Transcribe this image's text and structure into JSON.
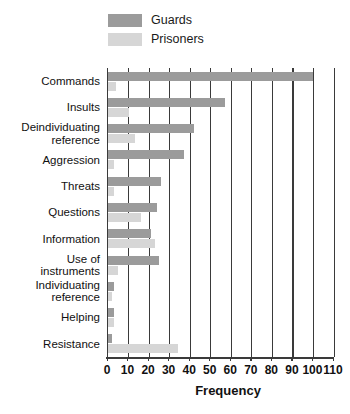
{
  "chart_data": {
    "type": "bar",
    "orientation": "horizontal",
    "title": "",
    "xlabel": "Frequency",
    "ylabel": "",
    "xlim": [
      0,
      110
    ],
    "xticks": [
      0,
      10,
      20,
      30,
      40,
      50,
      60,
      70,
      80,
      90,
      100,
      110
    ],
    "grid": true,
    "grid_axis": "x",
    "legend_position": "top-left",
    "categories": [
      "Commands",
      "Insults",
      "Deindividuating\nreference",
      "Aggression",
      "Threats",
      "Questions",
      "Information",
      "Use of\ninstruments",
      "Individuating\nreference",
      "Helping",
      "Resistance"
    ],
    "series": [
      {
        "name": "Guards",
        "color": "#9b9b9b",
        "values": [
          100,
          57,
          42,
          37,
          26,
          24,
          21,
          25,
          3,
          3,
          2
        ]
      },
      {
        "name": "Prisoners",
        "color": "#d6d6d6",
        "values": [
          4,
          10,
          13,
          3,
          3,
          16,
          23,
          5,
          2,
          3,
          34
        ]
      }
    ]
  },
  "legend": {
    "items": [
      {
        "label": "Guards",
        "color": "#9b9b9b"
      },
      {
        "label": "Prisoners",
        "color": "#d6d6d6"
      }
    ]
  },
  "axis": {
    "x_title": "Frequency",
    "tick_labels": [
      "0",
      "10",
      "20",
      "30",
      "40",
      "50",
      "60",
      "70",
      "80",
      "90",
      "100",
      "110"
    ]
  },
  "colors": {
    "guards": "#9b9b9b",
    "prisoners": "#d6d6d6",
    "axis": "#3a3a3a",
    "background": "#ffffff",
    "text": "#111111"
  }
}
